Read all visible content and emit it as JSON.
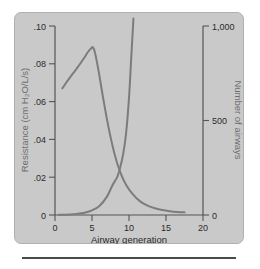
{
  "chart_data": {
    "type": "line",
    "title": "",
    "xlabel": "Airway generation",
    "ylabel_left": "Resistance (cm H₂O/L/s)",
    "ylabel_right": "Number of airways",
    "xlim": [
      0,
      20
    ],
    "xticks": [
      0,
      5,
      10,
      15,
      20
    ],
    "xticklabels": [
      "0",
      "5",
      "10",
      "15",
      "20"
    ],
    "ylim_left": [
      0,
      0.1
    ],
    "yticks_left": [
      0,
      0.02,
      0.04,
      0.06,
      0.08,
      0.1
    ],
    "yticklabels_left": [
      "0",
      ".02",
      ".04",
      ".06",
      ".08",
      ".10"
    ],
    "ylim_right": [
      0,
      1000
    ],
    "yticks_right": [
      0,
      500,
      1000
    ],
    "yticklabels_right": [
      "0",
      "500",
      "1,000"
    ],
    "grid": false,
    "legend": "none",
    "series": [
      {
        "name": "Resistance (cm H₂O/L/s)",
        "axis": "left",
        "x": [
          1.0,
          1.6,
          2.2,
          2.8,
          3.4,
          4.0,
          4.5,
          4.9,
          5.1,
          5.4,
          5.9,
          6.5,
          7.2,
          8.0,
          8.8,
          9.6,
          10.5,
          11.5,
          12.5,
          13.5,
          14.5,
          15.5,
          16.5,
          17.5
        ],
        "y": [
          0.067,
          0.0705,
          0.0737,
          0.0768,
          0.08,
          0.0835,
          0.0865,
          0.0882,
          0.0888,
          0.086,
          0.076,
          0.062,
          0.047,
          0.033,
          0.0228,
          0.016,
          0.011,
          0.0072,
          0.005,
          0.0036,
          0.0026,
          0.002,
          0.0016,
          0.0014
        ]
      },
      {
        "name": "Number of airways",
        "axis": "right",
        "x": [
          0.5,
          2.0,
          3.0,
          4.0,
          5.0,
          6.0,
          7.0,
          7.8,
          8.4,
          8.8,
          9.2,
          9.6,
          10.0,
          10.3,
          10.6
        ],
        "y": [
          1,
          3,
          6,
          12,
          24,
          48,
          96,
          160,
          200,
          250,
          320,
          430,
          620,
          830,
          1040
        ]
      }
    ]
  },
  "figure": {
    "panel_background": "#c9c9c9",
    "curve_color": "#7c7c7c",
    "axis_color": "#555555",
    "tick_label_color": "#2b2b2b",
    "axis_title_color": "#6e6e6e"
  }
}
